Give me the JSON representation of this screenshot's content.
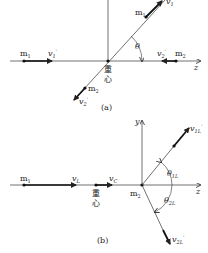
{
  "figure_a": {
    "caption": "(a)",
    "axis_label": "z",
    "center_label_1": "重",
    "center_label_2": "心",
    "m1_left": "m1",
    "m1_left_sub": "1",
    "v1_label": "v1'",
    "m2_right": "m2",
    "v2_right_label": "v2'",
    "m1_upper": "m1",
    "v1_upper_label": "v1'",
    "m2_lower": "m2",
    "v2_lower_label": "v2'",
    "angle_label": "θ"
  },
  "figure_b": {
    "caption": "(b)",
    "x_axis_label": "z",
    "y_axis_label": "y",
    "center_label_1": "重",
    "center_label_2": "心",
    "m1_label": "m1",
    "vL_label": "vL",
    "vC_label": "vC",
    "m2_label": "m2",
    "v1L_label": "v1L'",
    "v2L_label": "v2L'",
    "theta1_label": "θ1L",
    "theta2_label": "θ2L"
  },
  "text": {
    "m": "m",
    "v": "v",
    "sub1": "1",
    "sub2": "2",
    "prime": "′",
    "theta": "θ",
    "sub1L": "1L",
    "sub2L": "2L",
    "subL": "L",
    "subC": "C",
    "y": "y",
    "z": "z",
    "cap_a": "(a)",
    "cap_b": "(b)",
    "zhong": "重",
    "xin": "心"
  }
}
